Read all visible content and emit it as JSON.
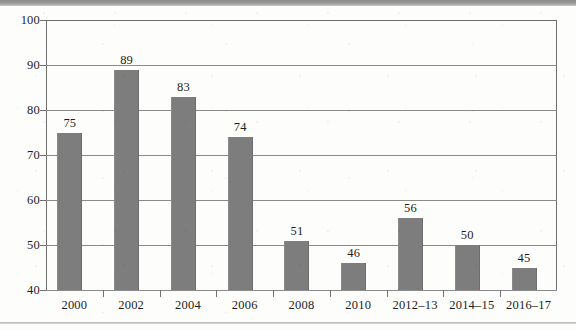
{
  "chart_data": {
    "type": "bar",
    "title": "",
    "subtitle": "",
    "xlabel": "",
    "ylabel": "",
    "categories": [
      "2000",
      "2002",
      "2004",
      "2006",
      "2008",
      "2010",
      "2012–13",
      "2014–15",
      "2016–17"
    ],
    "values": [
      75,
      89,
      83,
      74,
      51,
      46,
      56,
      50,
      45
    ],
    "value_labels": [
      "75",
      "89",
      "83",
      "74",
      "51",
      "46",
      "56",
      "50",
      "45"
    ],
    "ylim": [
      40,
      100
    ],
    "y_ticks": [
      40,
      50,
      60,
      70,
      80,
      90,
      100
    ],
    "y_tick_labels": [
      "40",
      "50",
      "60",
      "70",
      "80",
      "90",
      "100"
    ],
    "grid": true,
    "grid_axis": "y",
    "legend": null,
    "legend_position": "none",
    "bar_color": "#7d7d7d",
    "axis_color": "#6f6f6f",
    "grid_color": "#8a8a8a",
    "text_color": "#1d1d1d",
    "background_color": "#fdfdfc",
    "data_labels_shown": true
  }
}
